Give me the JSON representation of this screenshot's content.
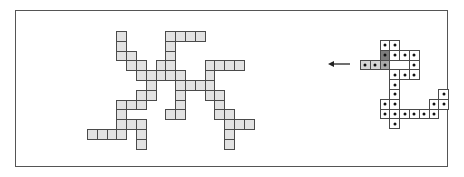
{
  "figure": {
    "frame": {
      "left": 15,
      "top": 10,
      "width": 433,
      "height": 157
    },
    "left_pattern": {
      "origin_x": 87,
      "origin_y": 31,
      "cell": 9.8,
      "fill": "#e2e2e2",
      "rows": [
        [
          3,
          8,
          9,
          10,
          11
        ],
        [
          3,
          8
        ],
        [
          3,
          4,
          8
        ],
        [
          4,
          5,
          7,
          8,
          12,
          13,
          14,
          15
        ],
        [
          5,
          6,
          7,
          8,
          9,
          12
        ],
        [
          6,
          9,
          10,
          11,
          12
        ],
        [
          5,
          6,
          9,
          12,
          13
        ],
        [
          3,
          4,
          5,
          9,
          13
        ],
        [
          3,
          8,
          9,
          13,
          14
        ],
        [
          3,
          4,
          5,
          14,
          15,
          16
        ],
        [
          0,
          1,
          2,
          3,
          5,
          14
        ],
        [
          5,
          14
        ]
      ]
    },
    "arrow": {
      "direction": "left",
      "icon": "arrow-left-icon"
    },
    "right_pattern": {
      "origin_x": 360,
      "origin_y": 40,
      "cell": 9.8,
      "cells": [
        {
          "r": 0,
          "c": 2,
          "shade": "white"
        },
        {
          "r": 0,
          "c": 3,
          "shade": "white"
        },
        {
          "r": 1,
          "c": 2,
          "shade": "dark"
        },
        {
          "r": 1,
          "c": 3,
          "shade": "white"
        },
        {
          "r": 1,
          "c": 4,
          "shade": "white"
        },
        {
          "r": 1,
          "c": 5,
          "shade": "white"
        },
        {
          "r": 2,
          "c": 0,
          "shade": "light"
        },
        {
          "r": 2,
          "c": 1,
          "shade": "light"
        },
        {
          "r": 2,
          "c": 2,
          "shade": "mid"
        },
        {
          "r": 2,
          "c": 5,
          "shade": "white"
        },
        {
          "r": 3,
          "c": 3,
          "shade": "white"
        },
        {
          "r": 3,
          "c": 4,
          "shade": "white"
        },
        {
          "r": 3,
          "c": 5,
          "shade": "white"
        },
        {
          "r": 4,
          "c": 3,
          "shade": "white"
        },
        {
          "r": 5,
          "c": 3,
          "shade": "white"
        },
        {
          "r": 5,
          "c": 8,
          "shade": "white"
        },
        {
          "r": 6,
          "c": 2,
          "shade": "white"
        },
        {
          "r": 6,
          "c": 3,
          "shade": "white"
        },
        {
          "r": 6,
          "c": 7,
          "shade": "white"
        },
        {
          "r": 6,
          "c": 8,
          "shade": "white"
        },
        {
          "r": 7,
          "c": 2,
          "shade": "white"
        },
        {
          "r": 7,
          "c": 3,
          "shade": "white"
        },
        {
          "r": 7,
          "c": 4,
          "shade": "white"
        },
        {
          "r": 7,
          "c": 5,
          "shade": "white"
        },
        {
          "r": 7,
          "c": 6,
          "shade": "white"
        },
        {
          "r": 7,
          "c": 7,
          "shade": "white"
        },
        {
          "r": 8,
          "c": 3,
          "shade": "white"
        }
      ],
      "dotted": true
    }
  }
}
